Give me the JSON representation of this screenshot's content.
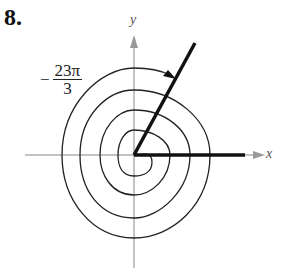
{
  "problem": {
    "number": "8."
  },
  "axes": {
    "x_label": "x",
    "y_label": "y",
    "axis_color": "#888888"
  },
  "angle": {
    "sign": "−",
    "numerator": "23π",
    "denominator": "3",
    "value_text": "-23π/3",
    "direction": "clockwise",
    "spiral_color": "#222222",
    "ray_color": "#111111"
  }
}
